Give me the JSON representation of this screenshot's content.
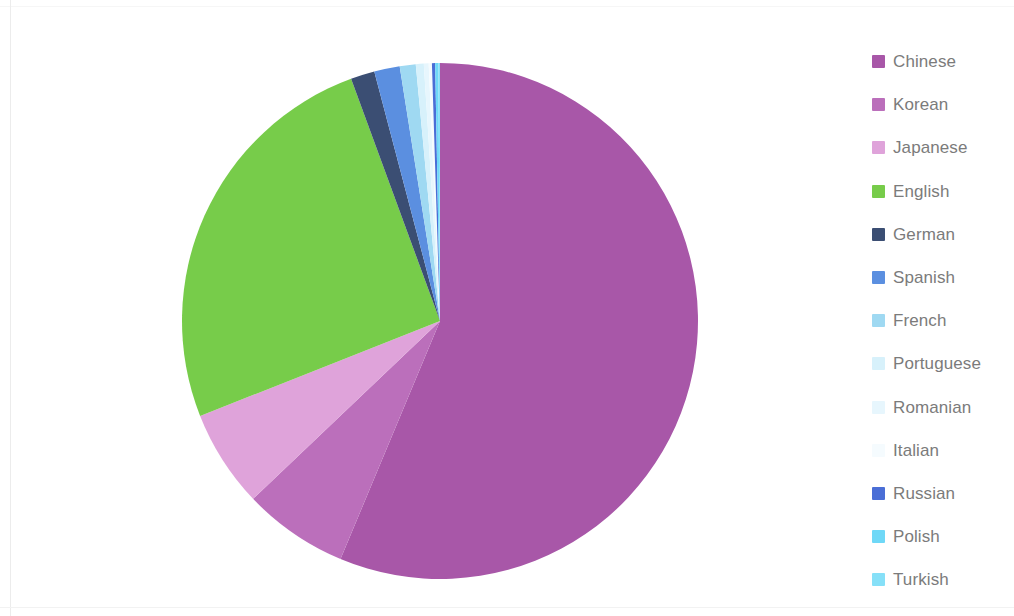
{
  "chart_data": {
    "type": "pie",
    "title": "",
    "subtitle": "",
    "xlabel": "",
    "ylabel": "",
    "grid": false,
    "legend_position": "right",
    "start_angle_deg": 0,
    "direction": "clockwise",
    "categories": [
      "Chinese",
      "Korean",
      "Japanese",
      "English",
      "German",
      "Spanish",
      "French",
      "Portuguese",
      "Romanian",
      "Italian",
      "Russian",
      "Polish",
      "Turkish"
    ],
    "values": [
      56.3,
      6.6,
      6.1,
      25.4,
      1.5,
      1.6,
      1.0,
      0.5,
      0.3,
      0.2,
      0.2,
      0.2,
      0.1
    ],
    "unit": "%",
    "colors": [
      "#a857a8",
      "#bb6fbb",
      "#dfa3da",
      "#77cc4a",
      "#3b4e73",
      "#5b8fe0",
      "#9fd9f2",
      "#d7f1fb",
      "#e7f6fd",
      "#f5fbfe",
      "#4a6ed6",
      "#6fd8f7",
      "#86e0f8"
    ],
    "series": [
      {
        "name": "Language share",
        "slices": [
          {
            "label": "Chinese",
            "value": 56.3,
            "color": "#a857a8"
          },
          {
            "label": "Korean",
            "value": 6.6,
            "color": "#bb6fbb"
          },
          {
            "label": "Japanese",
            "value": 6.1,
            "color": "#dfa3da"
          },
          {
            "label": "English",
            "value": 25.4,
            "color": "#77cc4a"
          },
          {
            "label": "German",
            "value": 1.5,
            "color": "#3b4e73"
          },
          {
            "label": "Spanish",
            "value": 1.6,
            "color": "#5b8fe0"
          },
          {
            "label": "French",
            "value": 1.0,
            "color": "#9fd9f2"
          },
          {
            "label": "Portuguese",
            "value": 0.5,
            "color": "#d7f1fb"
          },
          {
            "label": "Romanian",
            "value": 0.3,
            "color": "#e7f6fd"
          },
          {
            "label": "Italian",
            "value": 0.2,
            "color": "#f5fbfe"
          },
          {
            "label": "Russian",
            "value": 0.2,
            "color": "#4a6ed6"
          },
          {
            "label": "Polish",
            "value": 0.2,
            "color": "#6fd8f7"
          },
          {
            "label": "Turkish",
            "value": 0.1,
            "color": "#86e0f8"
          }
        ]
      }
    ]
  },
  "legend": {
    "items": [
      {
        "label": "Chinese",
        "color": "#a857a8"
      },
      {
        "label": "Korean",
        "color": "#bb6fbb"
      },
      {
        "label": "Japanese",
        "color": "#dfa3da"
      },
      {
        "label": "English",
        "color": "#77cc4a"
      },
      {
        "label": "German",
        "color": "#3b4e73"
      },
      {
        "label": "Spanish",
        "color": "#5b8fe0"
      },
      {
        "label": "French",
        "color": "#9fd9f2"
      },
      {
        "label": "Portuguese",
        "color": "#d7f1fb"
      },
      {
        "label": "Romanian",
        "color": "#e7f6fd"
      },
      {
        "label": "Italian",
        "color": "#f5fbfe"
      },
      {
        "label": "Russian",
        "color": "#4a6ed6"
      },
      {
        "label": "Polish",
        "color": "#6fd8f7"
      },
      {
        "label": "Turkish",
        "color": "#86e0f8"
      }
    ]
  },
  "geometry": {
    "center_x": 258,
    "center_y": 259,
    "radius": 258
  }
}
